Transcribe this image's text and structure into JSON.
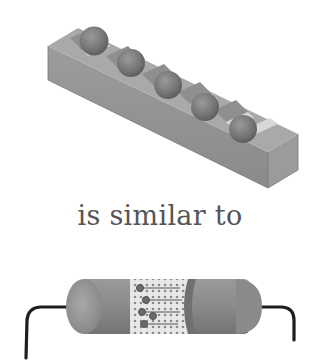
{
  "diagram": {
    "caption": "is similar to",
    "top_figure": {
      "description": "Isometric grey block with a row of V-shaped grooves holding spheres",
      "sphere_count": 5,
      "colors": {
        "block_top": "#a8a8a8",
        "block_side": "#8e8e8e",
        "block_end": "#9a9a9a",
        "groove_light": "#d9d9d9",
        "sphere": "#7a7a7a"
      }
    },
    "bottom_figure": {
      "description": "Cylindrical capsule (battery/cell) with wire leads and a transparent middle section showing particles and chains",
      "colors": {
        "body": "#8c8c8c",
        "end_cap": "#9e9e9e",
        "window": "#e6e6e6",
        "wire": "#1e1e1e",
        "particle": "#6a6a6a"
      }
    }
  }
}
